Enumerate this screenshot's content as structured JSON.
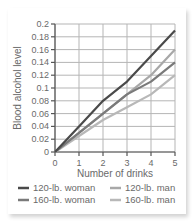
{
  "chart_data": {
    "type": "line",
    "title": "",
    "xlabel": "Number of drinks",
    "ylabel": "Blood alcohol level",
    "x": [
      0,
      1,
      2,
      3,
      4,
      5
    ],
    "xticks": [
      "0",
      "1",
      "2",
      "3",
      "4",
      "5"
    ],
    "yticks": [
      "0",
      "0.02",
      "0.04",
      "0.06",
      "0.08",
      "0.1",
      "0.12",
      "0.14",
      "0.16",
      "0.18",
      "0.2"
    ],
    "xlim": [
      0,
      5
    ],
    "ylim": [
      0,
      0.2
    ],
    "grid": true,
    "legend_position": "bottom",
    "series": [
      {
        "name": "120-lb. woman",
        "color": "#4a4a4a",
        "values": [
          0,
          0.04,
          0.08,
          0.11,
          0.15,
          0.19
        ]
      },
      {
        "name": "160-lb. woman",
        "color": "#7a7a7a",
        "values": [
          0,
          0.03,
          0.06,
          0.09,
          0.11,
          0.14
        ]
      },
      {
        "name": "120-lb. man",
        "color": "#a8a8a8",
        "values": [
          0,
          0.03,
          0.06,
          0.09,
          0.12,
          0.16
        ]
      },
      {
        "name": "160-lb. man",
        "color": "#b8b8b8",
        "values": [
          0,
          0.025,
          0.05,
          0.07,
          0.09,
          0.12
        ]
      }
    ]
  },
  "legend": {
    "items": [
      {
        "label": "120-lb. woman",
        "color": "#4a4a4a"
      },
      {
        "label": "160-lb. woman",
        "color": "#7a7a7a"
      },
      {
        "label": "120-lb. man",
        "color": "#a8a8a8"
      },
      {
        "label": "160-lb. man",
        "color": "#b8b8b8"
      }
    ]
  }
}
